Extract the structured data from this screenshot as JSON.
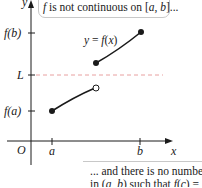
{
  "diagram": {
    "axes": {
      "x_label": "x",
      "y_label": "y",
      "origin_label": "O",
      "x_ticks": [
        {
          "label": "a"
        },
        {
          "label": "b"
        }
      ],
      "y_ticks": [
        {
          "label": "f(b)"
        },
        {
          "label": "L"
        },
        {
          "label": "f(a)"
        }
      ]
    },
    "curve_label": "y = f(x)",
    "segments": [
      {
        "name": "lower",
        "start": "closed at (a, f(a))",
        "end": "open circle"
      },
      {
        "name": "upper",
        "start": "closed dot",
        "end": "closed at (b, f(b))"
      }
    ],
    "reference_line": {
      "label": "L",
      "style": "dashed",
      "color": "#e8a0a0"
    },
    "callouts": {
      "top": {
        "text_parts": [
          "f",
          " is not continuous on [",
          "a",
          ", ",
          "b",
          "]..."
        ]
      },
      "bottom": {
        "line1_parts": [
          "... and there is no number ",
          "c"
        ],
        "line2_parts": [
          "in (",
          "a",
          ", ",
          "b",
          ") such that ",
          "f",
          "(",
          "c",
          ") = ",
          "L",
          "."
        ]
      }
    },
    "colors": {
      "axis": "#1a1a1a",
      "curve": "#1a1a1a",
      "dashed_line": "#e8a0a0",
      "callout_border": "#c8c8c8"
    }
  }
}
